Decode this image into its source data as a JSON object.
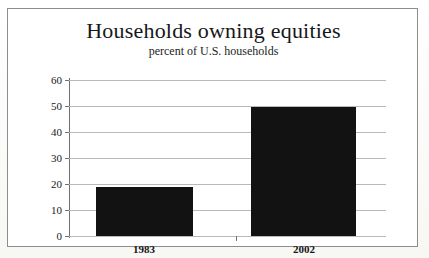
{
  "chart_data": {
    "type": "bar",
    "title": "Households owning equities",
    "subtitle": "percent of U.S. households",
    "xlabel": "",
    "ylabel": "",
    "categories": [
      "1983",
      "2002"
    ],
    "values": [
      19,
      49.5
    ],
    "ylim": [
      0,
      60
    ],
    "yticks": [
      "0",
      "10",
      "20",
      "30",
      "40",
      "50",
      "60"
    ],
    "ytick_values": [
      0,
      10,
      20,
      30,
      40,
      50,
      60
    ],
    "grid": "horizontal",
    "legend": "none",
    "series": [
      {
        "name": "percent of U.S. households",
        "values": [
          19,
          49.5
        ],
        "color": "#121212"
      }
    ]
  },
  "figure": {
    "frame_color": "#8d8d8d",
    "grid_color": "#b9b9b9",
    "axis_color": "#6f6f6f",
    "bar_color": "#121212",
    "background": "#ffffff"
  }
}
